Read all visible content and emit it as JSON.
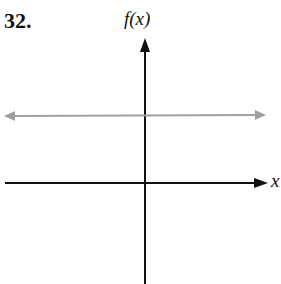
{
  "problem_number": "32.",
  "y_axis_label": "f(x)",
  "x_axis_label": "x",
  "colors": {
    "axes": "#111111",
    "graph_line": "#a0a0a0"
  },
  "graph": {
    "type": "horizontal line",
    "position": "above x-axis",
    "arrows": "both ends"
  }
}
